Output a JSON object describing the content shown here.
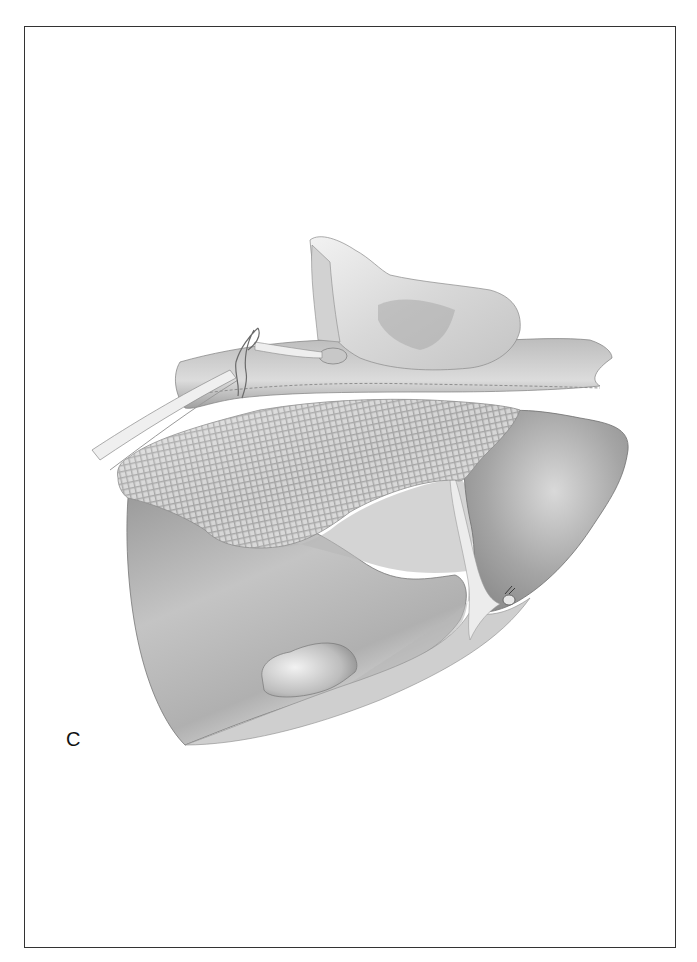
{
  "figure": {
    "panel_label": "C",
    "colors": {
      "frame_border": "#333333",
      "background": "#ffffff",
      "liver_fill": "#a9a9a9",
      "liver_light": "#d6d6d6",
      "mesh_fill": "#d9d9d9",
      "mesh_grid": "#9a9a9a",
      "omentum_fill": "#cfcfcf",
      "stomach_fill": "#e6e6e6"
    },
    "elements": [
      {
        "name": "liver-right-lobe"
      },
      {
        "name": "liver-left-lobe"
      },
      {
        "name": "mesh-packing"
      },
      {
        "name": "omentum-layer"
      },
      {
        "name": "stomach-retracted"
      },
      {
        "name": "clamp-instrument"
      },
      {
        "name": "suture-ties"
      },
      {
        "name": "falciform-ligament"
      },
      {
        "name": "ligament-stump-tie"
      },
      {
        "name": "gallbladder"
      }
    ]
  }
}
